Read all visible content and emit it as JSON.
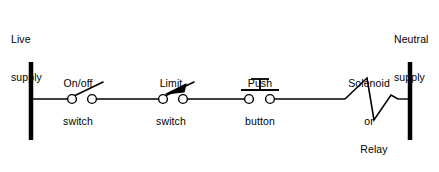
{
  "diagram": {
    "type": "electrical-schematic",
    "background_color": "#ffffff",
    "line_color": "#000000",
    "canvas": {
      "width": 439,
      "height": 172
    }
  },
  "rails": {
    "live": {
      "label_line1": "Live",
      "label_line2": "supply",
      "x": 31,
      "y_top": 62,
      "y_bottom": 140
    },
    "neutral": {
      "label_line1": "Neutral",
      "label_line2": "supply",
      "x": 410,
      "y_top": 62,
      "y_bottom": 140
    }
  },
  "wire": {
    "y": 99,
    "x_start": 31,
    "x_end": 410
  },
  "components": [
    {
      "name": "on-off-switch",
      "label_line1": "On/off",
      "label_line2": "switch",
      "symbol": "open-switch",
      "contact_left_x": 72,
      "contact_right_x": 92,
      "lever_tip_x": 103,
      "lever_tip_y": 82
    },
    {
      "name": "limit-switch",
      "label_line1": "Limit",
      "label_line2": "switch",
      "symbol": "open-switch-with-arrowhead",
      "contact_left_x": 163,
      "contact_right_x": 183,
      "lever_tip_x": 194,
      "lever_tip_y": 82
    },
    {
      "name": "push-button",
      "label_line1": "Push",
      "label_line2": "button",
      "symbol": "push-button",
      "contact_left_x": 249,
      "contact_right_x": 270,
      "bar_left_x": 241,
      "bar_right_x": 279,
      "bar_y": 90,
      "plunger_top_y": 78,
      "plunger_cap_half_width": 9
    },
    {
      "name": "solenoid-relay-coil",
      "label_line1": "Solenoid",
      "label_line2": "or",
      "label_line3": "Relay",
      "label_line4": "coil",
      "symbol": "zigzag-coil",
      "x_start": 345,
      "x_end": 398,
      "peak_x": 367,
      "peak_y": 78,
      "valley_x": 374,
      "valley_y": 120
    }
  ]
}
